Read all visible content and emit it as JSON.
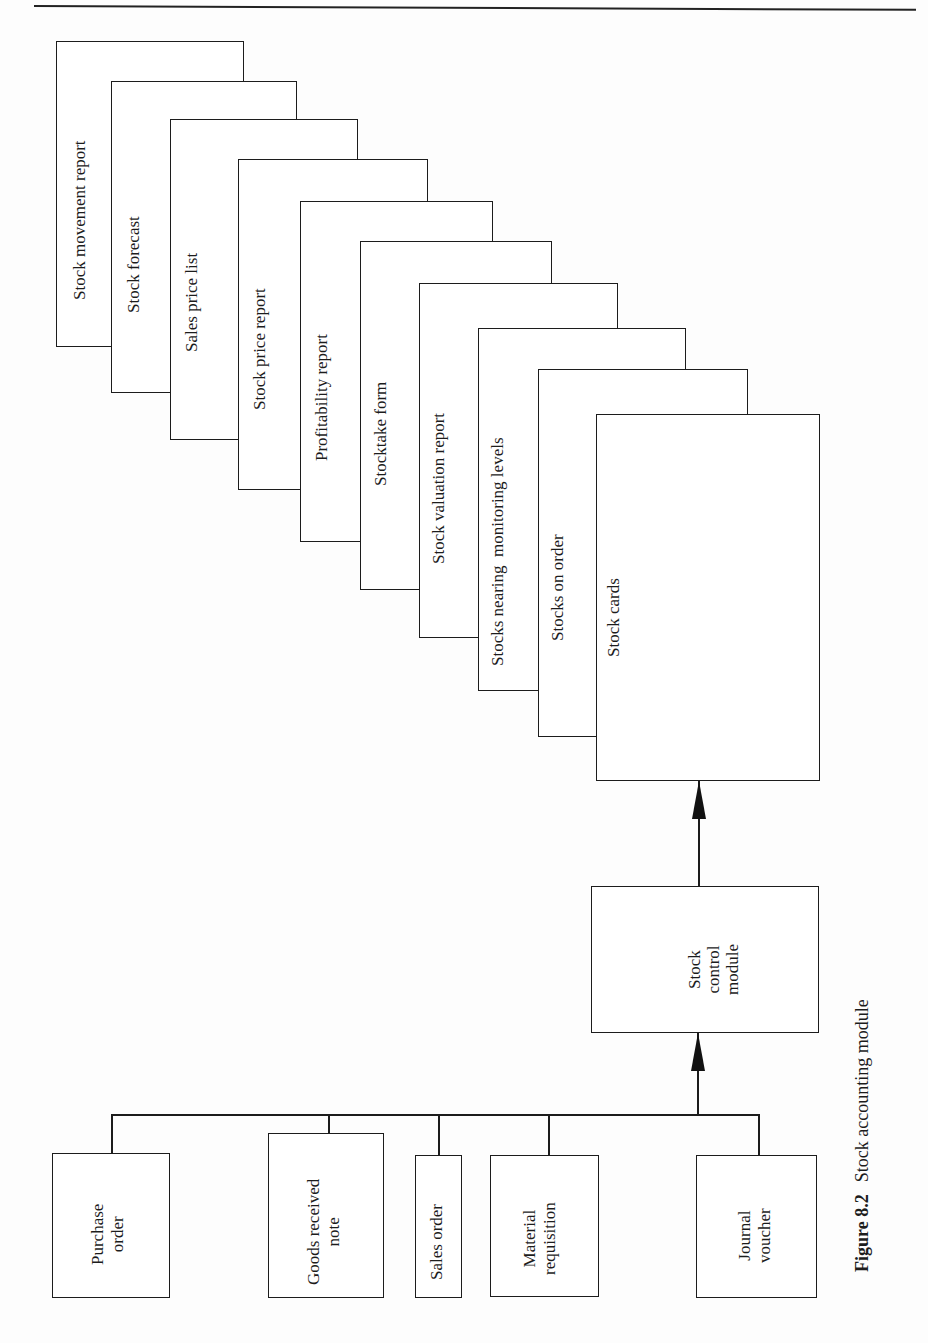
{
  "figure": {
    "number": "Figure 8.2",
    "title": "Stock accounting module"
  },
  "outputs": [
    {
      "label": "Stock movement report"
    },
    {
      "label": "Stock forecast"
    },
    {
      "label": "Sales price list"
    },
    {
      "label": "Stock price report"
    },
    {
      "label": "Profitability report"
    },
    {
      "label": "Stocktake form"
    },
    {
      "label": "Stock valuation report"
    },
    {
      "label": "Stocks nearing  monitoring levels"
    },
    {
      "label": "Stocks on order"
    },
    {
      "label": "Stock cards"
    }
  ],
  "module": {
    "label": "Stock\ncontrol\nmodule"
  },
  "inputs": [
    {
      "label": "Purchase\norder"
    },
    {
      "label": "Goods received\nnote"
    },
    {
      "label": "Sales order"
    },
    {
      "label": "Material\nrequisition"
    },
    {
      "label": "Journal\nvoucher"
    }
  ],
  "colors": {
    "ink": "#1c1c1c",
    "paper": "#ffffff"
  }
}
